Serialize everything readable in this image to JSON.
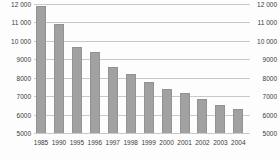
{
  "chart_data": {
    "type": "bar",
    "title": "",
    "xlabel": "",
    "ylabel": "",
    "categories": [
      "1985",
      "1990",
      "1995",
      "1996",
      "1997",
      "1998",
      "1999",
      "2000",
      "2001",
      "2002",
      "2003",
      "2004"
    ],
    "values": [
      11900,
      10950,
      9700,
      9400,
      8600,
      8250,
      7800,
      7400,
      7200,
      6850,
      6550,
      6350
    ],
    "y_axis": {
      "min": 5000,
      "max": 12000,
      "step": 1000,
      "tick_labels_top_to_bottom": [
        "12 000",
        "11 000",
        "10 000",
        "9000",
        "8000",
        "7000",
        "6000",
        "5000"
      ],
      "sides": [
        "left",
        "right"
      ]
    },
    "grid": true,
    "legend": false,
    "colors": {
      "bar_fill": "#a1a1a1",
      "bar_border": "#929292",
      "gridline": "#c9c9c9",
      "text": "#3a3a3a",
      "background": "#fdfdfd"
    }
  }
}
